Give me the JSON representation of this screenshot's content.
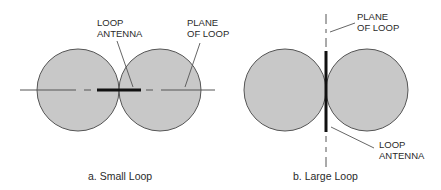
{
  "colors": {
    "lobe_fill": "#c8c8c8",
    "lobe_stroke": "#555555",
    "line": "#555555",
    "antenna": "#111111",
    "text": "#2a2a2a"
  },
  "panel_a": {
    "caption": "a. Small Loop",
    "labels": {
      "antenna_line1": "LOOP",
      "antenna_line2": "ANTENNA",
      "plane_line1": "PLANE",
      "plane_line2": "OF LOOP"
    }
  },
  "panel_b": {
    "caption": "b. Large Loop",
    "labels": {
      "plane_line1": "PLANE",
      "plane_line2": "OF LOOP",
      "antenna_line1": "LOOP",
      "antenna_line2": "ANTENNA"
    }
  }
}
